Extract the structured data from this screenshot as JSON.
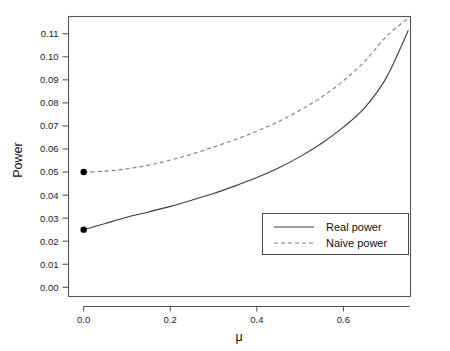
{
  "chart_data": {
    "type": "line",
    "title": "",
    "xlabel": "μ",
    "ylabel": "Power",
    "xlim": [
      -0.035,
      0.755
    ],
    "ylim": [
      -0.004,
      0.1175
    ],
    "grid": false,
    "legend_position": "bottom-right",
    "xticks": [
      0.0,
      0.2,
      0.4,
      0.6
    ],
    "xtick_labels": [
      "0.0",
      "0.2",
      "0.4",
      "0.6"
    ],
    "yticks": [
      0.0,
      0.01,
      0.02,
      0.03,
      0.04,
      0.05,
      0.06,
      0.07,
      0.08,
      0.09,
      0.1,
      0.11
    ],
    "ytick_labels": [
      "0.00",
      "0.01",
      "0.02",
      "0.03",
      "0.04",
      "0.05",
      "0.06",
      "0.07",
      "0.08",
      "0.09",
      "0.10",
      "0.11"
    ],
    "x": [
      0.0,
      0.05,
      0.1,
      0.15,
      0.2,
      0.25,
      0.3,
      0.35,
      0.4,
      0.45,
      0.5,
      0.55,
      0.6,
      0.65,
      0.7,
      0.75
    ],
    "series": [
      {
        "name": "Real power",
        "style": "solid",
        "color": "#3c3c3c",
        "marker_at_zero": true,
        "marker_value": 0.025,
        "values": [
          0.025,
          0.0277,
          0.0304,
          0.0327,
          0.0351,
          0.0378,
          0.0407,
          0.044,
          0.0476,
          0.0518,
          0.0567,
          0.0625,
          0.0695,
          0.0781,
          0.0912,
          0.1115
        ]
      },
      {
        "name": "Naive power",
        "style": "dashed",
        "color": "#7e7e7e",
        "marker_at_zero": true,
        "marker_value": 0.05,
        "values": [
          0.05,
          0.0504,
          0.0514,
          0.053,
          0.0552,
          0.0578,
          0.0608,
          0.0641,
          0.0677,
          0.0719,
          0.0768,
          0.0826,
          0.0896,
          0.0982,
          0.109,
          0.1168
        ]
      }
    ],
    "endpoint_markers": [
      {
        "x": 0.0,
        "y": 0.025,
        "series": "Real power"
      },
      {
        "x": 0.0,
        "y": 0.05,
        "series": "Naive power"
      }
    ]
  },
  "legend": {
    "entries": [
      {
        "label": "Real power",
        "style": "solid"
      },
      {
        "label": "Naive power",
        "style": "dashed"
      }
    ]
  }
}
